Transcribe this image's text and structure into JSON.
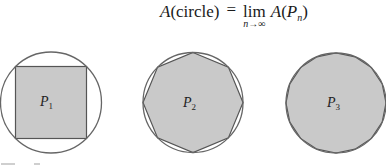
{
  "formula": {
    "lhs_func": "A",
    "lhs_arg": "(circle)",
    "equals": "=",
    "lim_word": "lim",
    "lim_sub": "n→∞",
    "rhs_func": "A",
    "rhs_open": "(",
    "rhs_var": "P",
    "rhs_sub": "n",
    "rhs_close": ")"
  },
  "figures": [
    {
      "label": "P",
      "sub": "1",
      "polygon_sides": 4
    },
    {
      "label": "P",
      "sub": "2",
      "polygon_sides": 8
    },
    {
      "label": "P",
      "sub": "3",
      "polygon_sides": 16
    }
  ],
  "colors": {
    "polygon_fill": "#c9c9c9",
    "stroke": "#555555",
    "background": "#ffffff"
  }
}
